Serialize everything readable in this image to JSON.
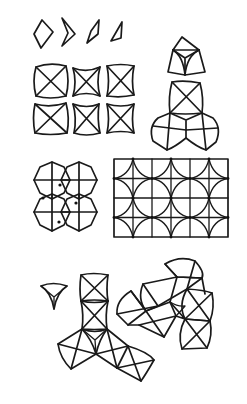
{
  "diagram": {
    "background": "#ffffff",
    "stroke": "#1a1a1a",
    "groups": [
      {
        "id": "kite-sequence",
        "label": "Four kite/dart quadrilaterals, progressively narrowing"
      },
      {
        "id": "square-tiles",
        "label": "2x3 grid of squares with diagonals and curved edges"
      },
      {
        "id": "triad-stack",
        "label": "Triangle-cornered tile above stacked squares and fan"
      },
      {
        "id": "four-circle-rosette",
        "label": "Four circles with crosshairs arranged 2x2"
      },
      {
        "id": "grid-lattice",
        "label": "Rectangular grid with overlaid concave arcs",
        "cols": 6,
        "rows": 4
      },
      {
        "id": "small-triangle",
        "label": "Small concave triangle with internal Y"
      },
      {
        "id": "tripod-cluster",
        "label": "Three-armed arrangement of X-crossed tiles"
      },
      {
        "id": "flower-cluster",
        "label": "Petal cluster of X-crossed tiles"
      }
    ]
  }
}
